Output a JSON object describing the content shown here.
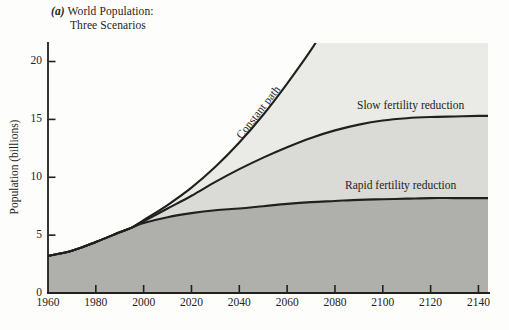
{
  "header": {
    "tag": "(a)",
    "title_line1": "World Population:",
    "title_line2": "Three Scenarios"
  },
  "chart_data": {
    "type": "area",
    "title": "(a) World Population: Three Scenarios",
    "xlabel": "",
    "ylabel": "Population (billions)",
    "x_ticks": [
      "1960",
      "1980",
      "2000",
      "2020",
      "2040",
      "2060",
      "2080",
      "2100",
      "2120",
      "2140"
    ],
    "y_ticks": [
      "0",
      "5",
      "10",
      "15",
      "20"
    ],
    "xlim": [
      1960,
      2144
    ],
    "ylim": [
      0,
      21.6
    ],
    "grid": false,
    "legend": "inline-labels-on-chart",
    "years": [
      1960,
      1970,
      1980,
      1990,
      1995,
      2000,
      2010,
      2020,
      2030,
      2040,
      2050,
      2060,
      2070,
      2080,
      2090,
      2100,
      2110,
      2120,
      2130,
      2140,
      2144
    ],
    "series": [
      {
        "name": "Constant path",
        "fill": "#eaeae6",
        "values": [
          3.2,
          3.65,
          4.4,
          5.25,
          5.65,
          6.3,
          7.6,
          9.1,
          10.9,
          13.0,
          15.4,
          18.1,
          21.0,
          24.3,
          null,
          null,
          null,
          null,
          null,
          null,
          null
        ],
        "note": "exits top of chart (~21.6 billion) around 2072"
      },
      {
        "name": "Slow fertility reduction",
        "fill": "#dadad6",
        "values": [
          3.2,
          3.65,
          4.4,
          5.25,
          5.65,
          6.2,
          7.3,
          8.4,
          9.6,
          10.7,
          11.7,
          12.6,
          13.4,
          14.05,
          14.55,
          14.9,
          15.1,
          15.2,
          15.25,
          15.3,
          15.3
        ]
      },
      {
        "name": "Rapid fertility reduction",
        "fill": "#afafab",
        "values": [
          3.2,
          3.65,
          4.4,
          5.25,
          5.65,
          6.05,
          6.55,
          6.9,
          7.15,
          7.3,
          7.5,
          7.7,
          7.85,
          7.95,
          8.05,
          8.1,
          8.15,
          8.2,
          8.2,
          8.2,
          8.2
        ]
      }
    ],
    "colors": {
      "line": "#21201e",
      "axis": "#21201e",
      "background": "#fdfdfb",
      "band_top": "#eaeae6",
      "band_middle": "#dadad6",
      "band_bottom": "#afafab"
    }
  }
}
